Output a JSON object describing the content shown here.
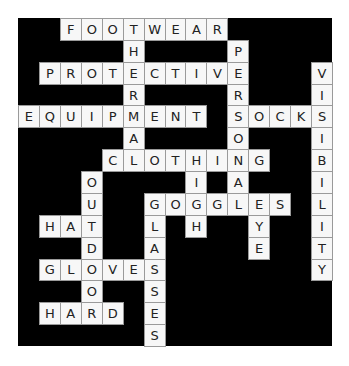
{
  "puzzle": {
    "type": "crossword",
    "rows": 15,
    "cols": 15,
    "colors": {
      "board": "#000000",
      "cell": "#f7f7f7",
      "text": "#222222",
      "border": "#9a9a9a"
    },
    "words": [
      {
        "word": "FOOTWEAR",
        "dir": "across",
        "row": 0,
        "col": 2
      },
      {
        "word": "PROTECTIVE",
        "dir": "across",
        "row": 2,
        "col": 1
      },
      {
        "word": "EQUIPMENT",
        "dir": "across",
        "row": 4,
        "col": 0
      },
      {
        "word": "SOCKS",
        "dir": "across",
        "row": 4,
        "col": 10
      },
      {
        "word": "CLOTHING",
        "dir": "across",
        "row": 6,
        "col": 4
      },
      {
        "word": "GOGGLES",
        "dir": "across",
        "row": 8,
        "col": 6
      },
      {
        "word": "HAT",
        "dir": "across",
        "row": 9,
        "col": 1
      },
      {
        "word": "GLOVES",
        "dir": "across",
        "row": 11,
        "col": 1
      },
      {
        "word": "HARD",
        "dir": "across",
        "row": 13,
        "col": 1
      },
      {
        "word": "THERMAL",
        "dir": "down",
        "row": 0,
        "col": 5
      },
      {
        "word": "PERSONAL",
        "dir": "down",
        "row": 1,
        "col": 10
      },
      {
        "word": "VISIBILITY",
        "dir": "down",
        "row": 2,
        "col": 14
      },
      {
        "word": "HIGH",
        "dir": "down",
        "row": 6,
        "col": 8
      },
      {
        "word": "OUTDOOR",
        "dir": "down",
        "row": 7,
        "col": 3
      },
      {
        "word": "GLASSES",
        "dir": "down",
        "row": 8,
        "col": 6
      },
      {
        "word": "EYE",
        "dir": "down",
        "row": 8,
        "col": 11
      }
    ]
  }
}
